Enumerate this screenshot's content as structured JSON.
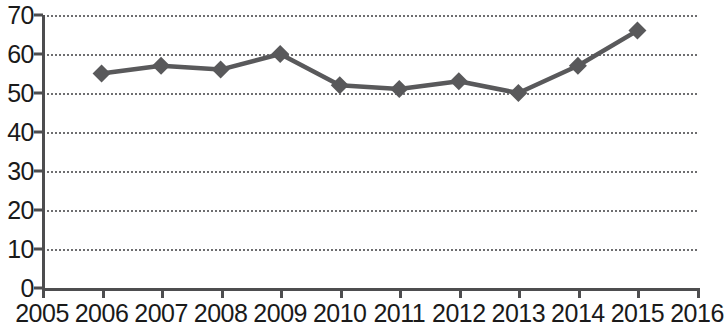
{
  "chart_data": {
    "type": "line",
    "title": "",
    "subtitle": "",
    "xlabel": "",
    "ylabel": "",
    "grid": true,
    "legend": false,
    "legend_position": "none",
    "series_color": "#59595b",
    "marker": "diamond",
    "x": [
      2006,
      2007,
      2008,
      2009,
      2010,
      2011,
      2012,
      2013,
      2014,
      2015
    ],
    "values": [
      55,
      57,
      56,
      60,
      52,
      51,
      53,
      50,
      57,
      66
    ],
    "series": [
      {
        "name": "",
        "x": [
          2006,
          2007,
          2008,
          2009,
          2010,
          2011,
          2012,
          2013,
          2014,
          2015
        ],
        "values": [
          55,
          57,
          56,
          60,
          52,
          51,
          53,
          50,
          57,
          66
        ]
      }
    ],
    "xlim": [
      2005,
      2016
    ],
    "ylim": [
      0,
      70
    ],
    "x_ticks": [
      "2005",
      "2006",
      "2007",
      "2008",
      "2009",
      "2010",
      "2011",
      "2012",
      "2013",
      "2014",
      "2015",
      "2016"
    ],
    "y_ticks": [
      "0",
      "10",
      "20",
      "30",
      "40",
      "50",
      "60",
      "70"
    ],
    "y_tick_values": [
      0,
      10,
      20,
      30,
      40,
      50,
      60,
      70
    ]
  },
  "axes": {
    "y_labels": [
      "70",
      "60",
      "50",
      "40",
      "30",
      "20",
      "10",
      "0"
    ],
    "x_labels": [
      "2005",
      "2006",
      "2007",
      "2008",
      "2009",
      "2010",
      "2011",
      "2012",
      "2013",
      "2014",
      "2015",
      "2016"
    ]
  }
}
